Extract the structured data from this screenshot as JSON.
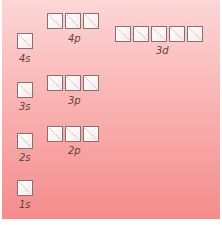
{
  "diagram": {
    "colors": {
      "background_top": "#fdd6d6",
      "background_bottom": "#f58c8c",
      "box_border": "#8a6f6f",
      "label_text": "#5a4444"
    },
    "orbitals": [
      {
        "name": "1s",
        "boxes": 1,
        "label": "1s"
      },
      {
        "name": "2s",
        "boxes": 1,
        "label": "2s"
      },
      {
        "name": "2p",
        "boxes": 3,
        "label": "2p"
      },
      {
        "name": "3s",
        "boxes": 1,
        "label": "3s"
      },
      {
        "name": "3p",
        "boxes": 3,
        "label": "3p"
      },
      {
        "name": "4s",
        "boxes": 1,
        "label": "4s"
      },
      {
        "name": "3d",
        "boxes": 5,
        "label": "3d"
      },
      {
        "name": "4p",
        "boxes": 3,
        "label": "4p"
      }
    ]
  }
}
